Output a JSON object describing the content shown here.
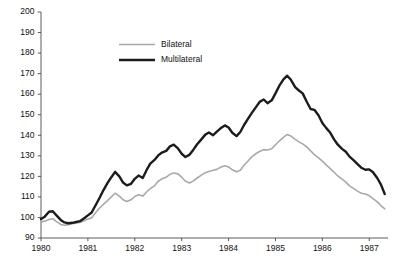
{
  "chart_data": {
    "type": "line",
    "title": "",
    "subtitle": "",
    "xlabel": "",
    "ylabel": "",
    "xlim": [
      1980.0,
      1987.4
    ],
    "ylim": [
      90,
      200
    ],
    "y_ticks": [
      90,
      100,
      110,
      120,
      130,
      140,
      150,
      160,
      170,
      180,
      190,
      200
    ],
    "x_ticks": [
      1980,
      1981,
      1982,
      1983,
      1984,
      1985,
      1986,
      1987
    ],
    "x_tick_labels": [
      "1980",
      "1981",
      "1982",
      "1983",
      "1984",
      "1985",
      "1986",
      "1987"
    ],
    "grid": false,
    "legend_position": "upper-left-inside",
    "series": [
      {
        "name": "Bilateral",
        "color": "#a9a9a9",
        "line_width": 1.6,
        "x": [
          1980.0,
          1980.08,
          1980.17,
          1980.25,
          1980.33,
          1980.42,
          1980.5,
          1980.58,
          1980.67,
          1980.75,
          1980.83,
          1980.92,
          1981.0,
          1981.08,
          1981.17,
          1981.25,
          1981.33,
          1981.42,
          1981.5,
          1981.58,
          1981.67,
          1981.75,
          1981.83,
          1981.92,
          1982.0,
          1982.08,
          1982.17,
          1982.25,
          1982.33,
          1982.42,
          1982.5,
          1982.58,
          1982.67,
          1982.75,
          1982.83,
          1982.92,
          1983.0,
          1983.08,
          1983.17,
          1983.25,
          1983.33,
          1983.42,
          1983.5,
          1983.58,
          1983.67,
          1983.75,
          1983.83,
          1983.92,
          1984.0,
          1984.08,
          1984.17,
          1984.25,
          1984.33,
          1984.42,
          1984.5,
          1984.58,
          1984.67,
          1984.75,
          1984.83,
          1984.92,
          1985.0,
          1985.08,
          1985.17,
          1985.25,
          1985.33,
          1985.42,
          1985.5,
          1985.58,
          1985.67,
          1985.75,
          1985.83,
          1985.92,
          1986.0,
          1986.08,
          1986.17,
          1986.25,
          1986.33,
          1986.42,
          1986.5,
          1986.58,
          1986.67,
          1986.75,
          1986.83,
          1986.92,
          1987.0,
          1987.08,
          1987.17,
          1987.25,
          1987.33
        ],
        "values": [
          97.8,
          98.2,
          99.0,
          99.4,
          98.0,
          96.6,
          96.2,
          96.5,
          97.0,
          97.3,
          97.6,
          98.4,
          99.2,
          99.8,
          102.5,
          104.6,
          106.4,
          108.2,
          110.0,
          111.8,
          110.4,
          108.6,
          107.8,
          108.6,
          110.2,
          111.0,
          110.4,
          112.4,
          114.0,
          115.4,
          117.6,
          118.8,
          119.6,
          121.0,
          121.6,
          121.2,
          119.6,
          117.6,
          116.8,
          117.8,
          119.2,
          120.6,
          121.8,
          122.4,
          123.0,
          123.4,
          124.4,
          125.2,
          124.6,
          123.2,
          122.2,
          123.0,
          125.4,
          127.6,
          129.6,
          131.0,
          132.2,
          133.0,
          132.8,
          133.4,
          135.4,
          137.2,
          139.0,
          140.4,
          139.6,
          138.0,
          136.8,
          135.8,
          134.2,
          132.4,
          130.6,
          129.0,
          127.4,
          125.6,
          123.8,
          122.0,
          120.2,
          118.6,
          117.2,
          115.4,
          114.0,
          112.8,
          111.8,
          111.4,
          110.6,
          109.2,
          107.6,
          105.8,
          104.2
        ]
      },
      {
        "name": "Multilateral",
        "color": "#1c1c1c",
        "line_width": 2.4,
        "x": [
          1980.0,
          1980.08,
          1980.17,
          1980.25,
          1980.33,
          1980.42,
          1980.5,
          1980.58,
          1980.67,
          1980.75,
          1980.83,
          1980.92,
          1981.0,
          1981.08,
          1981.17,
          1981.25,
          1981.33,
          1981.42,
          1981.5,
          1981.58,
          1981.67,
          1981.75,
          1981.83,
          1981.92,
          1982.0,
          1982.08,
          1982.17,
          1982.25,
          1982.33,
          1982.42,
          1982.5,
          1982.58,
          1982.67,
          1982.75,
          1982.83,
          1982.92,
          1983.0,
          1983.08,
          1983.17,
          1983.25,
          1983.33,
          1983.42,
          1983.5,
          1983.58,
          1983.67,
          1983.75,
          1983.83,
          1983.92,
          1984.0,
          1984.08,
          1984.17,
          1984.25,
          1984.33,
          1984.42,
          1984.5,
          1984.58,
          1984.67,
          1984.75,
          1984.83,
          1984.92,
          1985.0,
          1985.08,
          1985.17,
          1985.25,
          1985.33,
          1985.42,
          1985.5,
          1985.58,
          1985.67,
          1985.75,
          1985.83,
          1985.92,
          1986.0,
          1986.08,
          1986.17,
          1986.25,
          1986.33,
          1986.42,
          1986.5,
          1986.58,
          1986.67,
          1986.75,
          1986.83,
          1986.92,
          1987.0,
          1987.08,
          1987.17,
          1987.25,
          1987.33
        ],
        "values": [
          99.2,
          100.4,
          102.8,
          103.0,
          101.0,
          98.8,
          97.6,
          97.2,
          97.4,
          97.8,
          98.2,
          99.6,
          101.0,
          102.4,
          106.2,
          109.6,
          113.2,
          116.8,
          119.6,
          122.2,
          120.0,
          117.0,
          115.6,
          116.4,
          118.8,
          120.4,
          119.2,
          123.0,
          126.2,
          128.0,
          130.2,
          131.6,
          132.4,
          134.6,
          135.4,
          133.6,
          131.0,
          129.4,
          130.6,
          133.0,
          135.6,
          138.0,
          140.2,
          141.4,
          140.0,
          141.8,
          143.4,
          144.8,
          143.8,
          141.2,
          139.6,
          141.6,
          145.0,
          148.2,
          151.0,
          153.6,
          156.4,
          157.4,
          155.6,
          157.0,
          160.4,
          164.0,
          167.2,
          169.0,
          167.0,
          163.4,
          161.8,
          160.4,
          156.2,
          152.8,
          152.4,
          149.6,
          146.0,
          143.6,
          141.2,
          138.0,
          135.4,
          133.4,
          132.0,
          129.6,
          127.8,
          126.0,
          124.2,
          123.2,
          123.4,
          122.0,
          119.2,
          116.0,
          111.4
        ]
      }
    ]
  },
  "legend": {
    "entries": [
      {
        "label": "Bilateral"
      },
      {
        "label": "Multilateral"
      }
    ]
  }
}
